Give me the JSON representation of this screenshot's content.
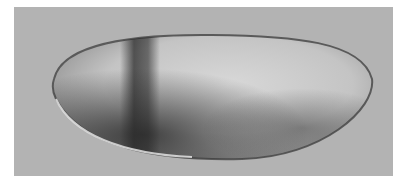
{
  "image": {
    "subject": "embryo micrograph",
    "description": "Elongated oval embryo on gray background with dark band near anterior third and dark ventral-posterior shading",
    "colors": {
      "border": "#ffffff",
      "background": "#b3b3b3",
      "embryo_light": "#d4d4d4",
      "embryo_dark": "#3a3a3a",
      "outline": "#5a5a5a"
    }
  }
}
